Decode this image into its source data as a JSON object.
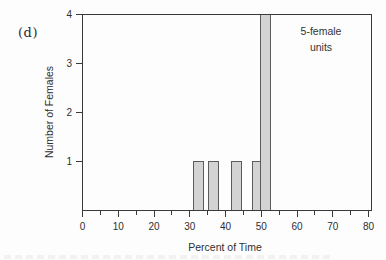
{
  "chart_data": {
    "type": "bar",
    "panel_label": "(d)",
    "xlabel": "Percent of Time",
    "ylabel": "Number of Females",
    "annotation": "5-female units",
    "annotation_lines": [
      "5-female",
      "units"
    ],
    "xlim": [
      0,
      80
    ],
    "ylim": [
      0,
      4
    ],
    "x_major_ticks": [
      0,
      10,
      20,
      30,
      40,
      50,
      60,
      70,
      80
    ],
    "x_minor_tick_step": 5,
    "y_major_ticks": [
      1,
      2,
      3,
      4
    ],
    "grid": "off",
    "frame": "box",
    "legend": "none",
    "bars": [
      {
        "x_start": 31.1,
        "x_end": 33.9,
        "count": 1
      },
      {
        "x_start": 35.3,
        "x_end": 38.1,
        "count": 1
      },
      {
        "x_start": 41.7,
        "x_end": 44.5,
        "count": 1
      },
      {
        "x_start": 47.6,
        "x_end": 49.8,
        "count": 1
      },
      {
        "x_start": 49.8,
        "x_end": 52.6,
        "count": 4
      }
    ],
    "colors": {
      "bar_fill": "#d3d3d3",
      "bar_stroke": "#5c5c5c",
      "axis": "#3a3a3a",
      "text": "#2f2f2f",
      "background": "#fdfdfd"
    }
  }
}
